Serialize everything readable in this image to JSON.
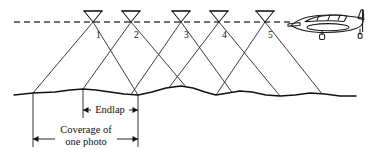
{
  "figure": {
    "kind": "aerial-photography-endlap-diagram",
    "background_color": "#ffffff",
    "line_color": "#1a1a1a",
    "flight_line_color": "#444444",
    "width": 370,
    "height": 157
  },
  "flight_line": {
    "label": "flight-line",
    "style": "dashed",
    "y": 22,
    "x_start": 14,
    "x_end": 292,
    "dash_pattern": "6,4"
  },
  "exposure_stations": [
    {
      "number": "1",
      "apex_x": 93,
      "apex_y": 22,
      "ground_left_x": 33,
      "ground_right_x": 138,
      "label_x": 96,
      "label_y": 38
    },
    {
      "number": "2",
      "apex_x": 131,
      "apex_y": 22,
      "ground_left_x": 83,
      "ground_right_x": 186,
      "label_x": 134,
      "label_y": 38
    },
    {
      "number": "3",
      "apex_x": 181,
      "apex_y": 22,
      "ground_left_x": 131,
      "ground_right_x": 232,
      "label_x": 184,
      "label_y": 38
    },
    {
      "number": "4",
      "apex_x": 219,
      "apex_y": 22,
      "ground_left_x": 169,
      "ground_right_x": 280,
      "label_x": 222,
      "label_y": 38
    },
    {
      "number": "5",
      "apex_x": 265,
      "apex_y": 22,
      "ground_left_x": 216,
      "ground_right_x": 322,
      "label_x": 268,
      "label_y": 38
    }
  ],
  "camera_symbol": {
    "name": "camera-cone-symbol",
    "half_width": 9,
    "top_y": 11,
    "description": "inverted triangle with flat top bar, apex on flight line"
  },
  "terrain": {
    "name": "ground-profile",
    "path": "M 14,95 L 33,93 L 55,92 L 70,90 L 83,89 L 96,90 L 110,92 L 124,94 L 138,95 L 152,92 L 166,88 L 181,86 L 193,88 L 205,92 L 216,95 L 228,93 L 240,91 L 252,92 L 266,95 L 280,96 L 295,95 L 310,93 L 325,94 L 340,96 L 356,96"
  },
  "dimensions": {
    "extension_lines": [
      {
        "name": "extension-line-left",
        "x": 33,
        "y_top": 93,
        "y_bottom": 147
      },
      {
        "name": "extension-line-middle",
        "x": 83,
        "y_top": 89,
        "y_bottom": 118
      },
      {
        "name": "extension-line-right",
        "x": 138,
        "y_top": 95,
        "y_bottom": 147
      }
    ],
    "endlap": {
      "label": "Endlap",
      "name": "endlap-dimension",
      "x_start": 83,
      "x_end": 138,
      "y": 110,
      "text_x": 110,
      "text_y": 113
    },
    "coverage": {
      "label_line1": "Coverage of",
      "label_line2": "one photo",
      "name": "coverage-dimension",
      "x_start": 33,
      "x_end": 138,
      "y": 139,
      "text_x": 86,
      "text_line1_y": 133,
      "text_line2_y": 145
    }
  },
  "aircraft": {
    "name": "airplane",
    "description": "single-engine light aircraft, side view, nose left",
    "x": 288,
    "y": 8,
    "width": 80,
    "height": 34
  }
}
